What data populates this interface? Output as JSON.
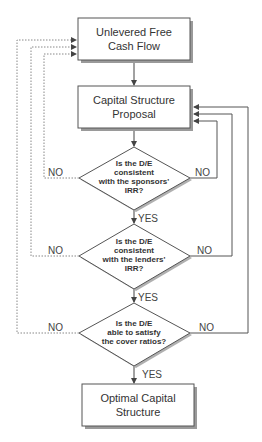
{
  "diagram": {
    "type": "flowchart",
    "colors": {
      "stroke": "#555555",
      "shadow": "#9a9a9a",
      "fill": "#ffffff",
      "text": "#333333"
    },
    "nodes": {
      "start": {
        "line1": "Unlevered Free",
        "line2": "Cash Flow"
      },
      "proposal": {
        "line1": "Capital Structure",
        "line2": "Proposal"
      },
      "decision1": {
        "line1": "Is the D/E",
        "line2": "consistent",
        "line3": "with the sponsors'",
        "line4": "IRR?"
      },
      "decision2": {
        "line1": "Is the D/E",
        "line2": "consistent",
        "line3": "with the lenders'",
        "line4": "IRR?"
      },
      "decision3": {
        "line1": "Is the D/E",
        "line2": "able to satisfy",
        "line3": "the cover ratios?"
      },
      "end": {
        "line1": "Optimal Capital",
        "line2": "Structure"
      }
    },
    "labels": {
      "d1_no_left": "NO",
      "d1_no_right": "NO",
      "d1_yes": "YES",
      "d2_no_left": "NO",
      "d2_no_right": "NO",
      "d2_yes": "YES",
      "d3_no_left": "NO",
      "d3_no_right": "NO",
      "d3_yes": "YES"
    },
    "edges": [
      {
        "from": "start",
        "to": "proposal",
        "style": "solid"
      },
      {
        "from": "proposal",
        "to": "decision1",
        "style": "solid"
      },
      {
        "from": "decision1",
        "to": "decision2",
        "label": "YES",
        "style": "solid"
      },
      {
        "from": "decision2",
        "to": "decision3",
        "label": "YES",
        "style": "solid"
      },
      {
        "from": "decision3",
        "to": "end",
        "label": "YES",
        "style": "solid"
      },
      {
        "from": "decision1",
        "to": "start",
        "label": "NO",
        "style": "dotted"
      },
      {
        "from": "decision2",
        "to": "start",
        "label": "NO",
        "style": "dotted"
      },
      {
        "from": "decision3",
        "to": "start",
        "label": "NO",
        "style": "dotted"
      },
      {
        "from": "decision1",
        "to": "proposal",
        "label": "NO",
        "style": "solid"
      },
      {
        "from": "decision2",
        "to": "proposal",
        "label": "NO",
        "style": "solid"
      },
      {
        "from": "decision3",
        "to": "proposal",
        "label": "NO",
        "style": "solid"
      }
    ]
  }
}
